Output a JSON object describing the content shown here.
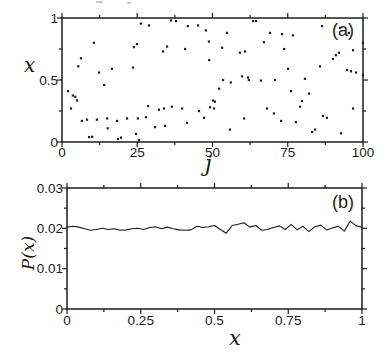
{
  "figure": {
    "background": "#ffffff",
    "ink_color": "#1c1c1c"
  },
  "chart_data": [
    {
      "id": "panel-a",
      "type": "scatter",
      "panel_label": "(a)",
      "xlabel": "j",
      "ylabel": "x",
      "xlim": [
        0,
        100
      ],
      "ylim": [
        0,
        1
      ],
      "grid": false,
      "ticks_direction": "out",
      "xticks": {
        "major": [
          0,
          25,
          50,
          75,
          100
        ],
        "minor": [
          12.5,
          37.5,
          62.5,
          87.5
        ],
        "labels": [
          "0",
          "25",
          "50",
          "75",
          "100"
        ]
      },
      "yticks": {
        "major": [
          0,
          0.5,
          1
        ],
        "minor": [
          0.25,
          0.75
        ],
        "labels": [
          "0",
          "0.5",
          "1"
        ]
      },
      "points": [
        [
          2,
          0.41
        ],
        [
          3,
          0.27
        ],
        [
          3.6,
          0.375
        ],
        [
          4.4,
          0.365
        ],
        [
          5,
          0.335
        ],
        [
          5.4,
          0.61
        ],
        [
          6.3,
          0.675
        ],
        [
          6.6,
          0.17
        ],
        [
          8.3,
          0.18
        ],
        [
          9,
          0.04
        ],
        [
          10,
          0.042
        ],
        [
          10.6,
          0.8
        ],
        [
          11.6,
          0.18
        ],
        [
          12.3,
          0.56
        ],
        [
          14,
          0.46
        ],
        [
          15,
          0.19
        ],
        [
          15.2,
          0.11
        ],
        [
          16.6,
          0.59
        ],
        [
          18.3,
          0.17
        ],
        [
          18.6,
          0.025
        ],
        [
          19.6,
          0.035
        ],
        [
          21.6,
          0.19
        ],
        [
          23.6,
          0.6
        ],
        [
          23.9,
          0.765
        ],
        [
          24.6,
          0.065
        ],
        [
          24.9,
          0.79
        ],
        [
          25.2,
          0.19
        ],
        [
          25.6,
          0.015
        ],
        [
          26.2,
          0.955
        ],
        [
          27.9,
          0.2
        ],
        [
          28.6,
          0.29
        ],
        [
          28.9,
          0.94
        ],
        [
          30.9,
          0.12
        ],
        [
          32.2,
          0.26
        ],
        [
          33.6,
          0.73
        ],
        [
          33.9,
          0.27
        ],
        [
          34.2,
          0.13
        ],
        [
          34.9,
          0.77
        ],
        [
          36.2,
          0.98
        ],
        [
          36.5,
          0.285
        ],
        [
          37.9,
          0.975
        ],
        [
          39.9,
          0.27
        ],
        [
          40.9,
          0.75
        ],
        [
          41.5,
          0.155
        ],
        [
          41.8,
          0.935
        ],
        [
          45.2,
          0.94
        ],
        [
          45.5,
          0.25
        ],
        [
          47.2,
          0.195
        ],
        [
          47.8,
          0.9
        ],
        [
          48.8,
          0.81
        ],
        [
          48.9,
          0.66
        ],
        [
          49.2,
          0.28
        ],
        [
          50.2,
          0.335
        ],
        [
          50.5,
          0.27
        ],
        [
          50.8,
          0.325
        ],
        [
          52.2,
          0.43
        ],
        [
          53.2,
          0.76
        ],
        [
          53.5,
          0.5
        ],
        [
          54.8,
          0.88
        ],
        [
          55.8,
          0.1
        ],
        [
          56.1,
          0.48
        ],
        [
          59.1,
          0.72
        ],
        [
          59.8,
          0.53
        ],
        [
          60.5,
          0.19
        ],
        [
          60.8,
          0.73
        ],
        [
          61.8,
          0.52
        ],
        [
          62.1,
          0.5
        ],
        [
          63.5,
          0.975
        ],
        [
          64.5,
          0.975
        ],
        [
          66.1,
          0.495
        ],
        [
          67.1,
          0.805
        ],
        [
          68.1,
          0.27
        ],
        [
          69.1,
          0.88
        ],
        [
          70.4,
          0.23
        ],
        [
          70.8,
          0.5
        ],
        [
          72.8,
          0.17
        ],
        [
          73.1,
          0.87
        ],
        [
          73.8,
          0.75
        ],
        [
          75.1,
          0.59
        ],
        [
          76.1,
          0.41
        ],
        [
          76.7,
          0.86
        ],
        [
          77.7,
          0.16
        ],
        [
          79.1,
          0.285
        ],
        [
          79.7,
          0.33
        ],
        [
          80.7,
          0.51
        ],
        [
          82.1,
          0.39
        ],
        [
          83.1,
          0.08
        ],
        [
          84.1,
          0.1
        ],
        [
          85.7,
          0.61
        ],
        [
          86.4,
          0.935
        ],
        [
          86.7,
          0.21
        ],
        [
          88,
          0.195
        ],
        [
          90,
          0.67
        ],
        [
          91,
          0.7
        ],
        [
          92,
          0.72
        ],
        [
          92.4,
          0.92
        ],
        [
          92.7,
          0.07
        ],
        [
          94.7,
          0.58
        ],
        [
          95.3,
          0.88
        ],
        [
          96,
          0.57
        ],
        [
          96.7,
          0.74
        ],
        [
          96.7,
          0.27
        ],
        [
          97.7,
          0.56
        ],
        [
          100,
          0.8
        ],
        [
          100,
          0.54
        ]
      ]
    },
    {
      "id": "panel-b",
      "type": "line",
      "panel_label": "(b)",
      "xlabel": "x",
      "ylabel": "P(x)",
      "xlim": [
        0,
        1
      ],
      "ylim": [
        0,
        0.03
      ],
      "grid": false,
      "ticks_direction": "out",
      "xticks": {
        "major": [
          0,
          0.25,
          0.5,
          0.75,
          1
        ],
        "minor": [
          0.125,
          0.375,
          0.625,
          0.875
        ],
        "labels": [
          "0",
          "0.25",
          "0.5",
          "0.75",
          "1"
        ]
      },
      "yticks": {
        "major": [
          0,
          0.01,
          0.02,
          0.03
        ],
        "minor": [
          0.005,
          0.015,
          0.025
        ],
        "labels": [
          "0",
          "0.01",
          "0.02",
          "0.03"
        ]
      },
      "x": [
        0,
        0.02,
        0.04,
        0.06,
        0.08,
        0.1,
        0.12,
        0.14,
        0.16,
        0.18,
        0.2,
        0.22,
        0.24,
        0.26,
        0.28,
        0.3,
        0.32,
        0.34,
        0.36,
        0.38,
        0.4,
        0.42,
        0.44,
        0.46,
        0.48,
        0.5,
        0.52,
        0.54,
        0.56,
        0.58,
        0.6,
        0.62,
        0.64,
        0.66,
        0.68,
        0.7,
        0.72,
        0.74,
        0.76,
        0.78,
        0.8,
        0.82,
        0.84,
        0.86,
        0.88,
        0.9,
        0.92,
        0.94,
        0.96,
        0.98,
        1.0
      ],
      "y": [
        0.0203,
        0.0205,
        0.0203,
        0.0199,
        0.0195,
        0.0197,
        0.02,
        0.0197,
        0.0199,
        0.0195,
        0.0196,
        0.0199,
        0.02,
        0.0197,
        0.0202,
        0.0204,
        0.0199,
        0.0203,
        0.0199,
        0.0196,
        0.0195,
        0.0196,
        0.0205,
        0.0202,
        0.0204,
        0.0207,
        0.0197,
        0.0188,
        0.0207,
        0.021,
        0.0214,
        0.0203,
        0.0207,
        0.0195,
        0.0197,
        0.0202,
        0.0206,
        0.0197,
        0.021,
        0.0196,
        0.0205,
        0.0192,
        0.0204,
        0.0208,
        0.0196,
        0.0201,
        0.0205,
        0.0193,
        0.0218,
        0.0206,
        0.0203
      ]
    }
  ]
}
